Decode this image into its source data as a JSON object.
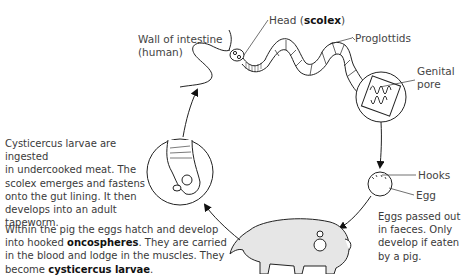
{
  "labels": {
    "wall_line1": "Wall of intestine",
    "wall_line2": "(human)",
    "head_prefix": "Head (",
    "head_bold": "scolex",
    "head_suffix": ")",
    "proglottids": "Proglottids",
    "genital_line1": "Genital",
    "genital_line2": "pore",
    "hooks": "Hooks",
    "egg": "Egg"
  },
  "notes": {
    "larvae_ingested": {
      "lines": [
        "Cysticercus larvae are ingested",
        "in undercooked meat.  The",
        "scolex emerges and fastens",
        "onto the gut lining.  It then",
        "develops into an adult",
        "tapeworm."
      ]
    },
    "pig_stage": {
      "line1": "Within the pig the eggs hatch and develop",
      "line2_prefix": "into hooked ",
      "line2_bold": "oncospheres",
      "line2_suffix": ".  They are carried",
      "line3": "in the blood and lodge in the muscles.  They",
      "line4_prefix": "become ",
      "line4_bold": "cysticercus larvae",
      "line4_suffix": "."
    },
    "eggs_passed": {
      "lines": [
        "Eggs passed out",
        "in faeces.  Only",
        "develop if eaten",
        "by a pig."
      ]
    }
  },
  "colors": {
    "line": "#222222",
    "text": "#444444",
    "pig_fill": "#e6e6e6"
  }
}
